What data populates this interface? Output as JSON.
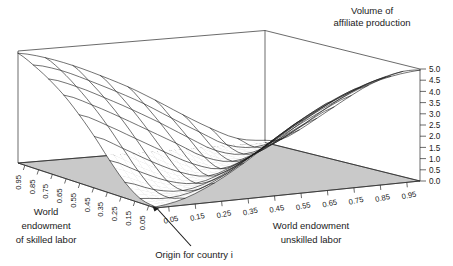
{
  "figure": {
    "title_line1": "Volume of",
    "title_line2": "affiliate production",
    "annotation": "Origin for country i",
    "background_color": "#ffffff",
    "base_plane_color": "#c9c9c9",
    "mesh_color": "#1c1c1c"
  },
  "axes": {
    "x": {
      "label_line1": "World endowment",
      "label_line2": "unskilled labor",
      "ticks": [
        "0.05",
        "0.15",
        "0.25",
        "0.35",
        "0.45",
        "0.55",
        "0.65",
        "0.75",
        "0.85",
        "0.95"
      ]
    },
    "y": {
      "label_line1": "World",
      "label_line2": "endowment",
      "label_line3": "of skilled labor",
      "ticks": [
        "0.95",
        "0.85",
        "0.75",
        "0.65",
        "0.55",
        "0.45",
        "0.35",
        "0.25",
        "0.15",
        "0.05"
      ]
    },
    "z": {
      "ticks": [
        "5.0",
        "4.5",
        "4.0",
        "3.5",
        "3.0",
        "2.5",
        "2.0",
        "1.5",
        "1.0",
        "0.5",
        "0.0"
      ]
    }
  },
  "chart_data": {
    "type": "surface",
    "title": "Volume of affiliate production",
    "xlabel": "World endowment unskilled labor",
    "ylabel": "World endowment of skilled labor",
    "zlabel": "Volume of affiliate production",
    "xlim": [
      0.05,
      0.95
    ],
    "ylim": [
      0.05,
      0.95
    ],
    "zlim": [
      0.0,
      5.0
    ],
    "ztick_step": 0.5,
    "grid": false,
    "legend": null,
    "annotations": [
      {
        "text": "Origin for country i",
        "points_to": "front origin corner (x=0.05, y=0.05)"
      }
    ],
    "x": [
      0.05,
      0.15,
      0.25,
      0.35,
      0.45,
      0.55,
      0.65,
      0.75,
      0.85,
      0.95
    ],
    "y": [
      0.05,
      0.15,
      0.25,
      0.35,
      0.45,
      0.55,
      0.65,
      0.75,
      0.85,
      0.95
    ],
    "z_rows": [
      [
        0.05,
        0.3,
        0.85,
        1.6,
        2.45,
        3.25,
        3.95,
        4.45,
        4.8,
        4.95
      ],
      [
        0.2,
        0.1,
        0.35,
        0.95,
        1.75,
        2.6,
        3.35,
        3.95,
        4.4,
        4.7
      ],
      [
        0.7,
        0.25,
        0.08,
        0.4,
        1.05,
        1.85,
        2.65,
        3.3,
        3.85,
        4.25
      ],
      [
        1.45,
        0.85,
        0.3,
        0.07,
        0.45,
        1.1,
        1.9,
        2.6,
        3.2,
        3.7
      ],
      [
        2.3,
        1.65,
        0.95,
        0.35,
        0.06,
        0.48,
        1.15,
        1.85,
        2.5,
        3.05
      ],
      [
        3.05,
        2.45,
        1.75,
        1.05,
        0.4,
        0.06,
        0.45,
        1.1,
        1.75,
        2.35
      ],
      [
        3.7,
        3.15,
        2.5,
        1.8,
        1.1,
        0.38,
        0.07,
        0.42,
        1.05,
        1.65
      ],
      [
        4.2,
        3.75,
        3.15,
        2.5,
        1.8,
        1.05,
        0.35,
        0.08,
        0.4,
        0.95
      ],
      [
        4.6,
        4.25,
        3.7,
        3.1,
        2.45,
        1.7,
        0.98,
        0.3,
        0.09,
        0.35
      ],
      [
        4.9,
        4.6,
        4.15,
        3.6,
        3.0,
        2.3,
        1.55,
        0.85,
        0.28,
        0.1
      ]
    ]
  }
}
